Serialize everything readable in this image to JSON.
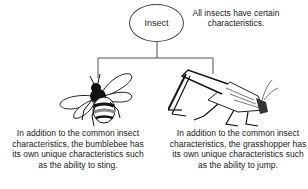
{
  "diagram": {
    "type": "hierarchy",
    "root": {
      "label": "Insect",
      "note": "All insects have certain characteristics."
    },
    "children": [
      {
        "name": "bumblebee",
        "icon": "bumblebee-icon",
        "caption": "In addition to the common insect characteristics, the bumblebee has its own unique characteristics such as the ability to sting."
      },
      {
        "name": "grasshopper",
        "icon": "grasshopper-icon",
        "caption": "In addition to the common insect characteristics, the grasshopper has its own unique characteristics such as the ability to jump."
      }
    ],
    "colors": {
      "line": "#555555",
      "text": "#1a1a1a",
      "background": "#ffffff"
    }
  }
}
